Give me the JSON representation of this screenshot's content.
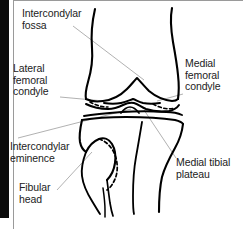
{
  "figure": {
    "kind": "anatomical-line-drawing",
    "bone_outline_color": "#000000",
    "leader_line_color": "#a8a8a8",
    "text_color": "#222222",
    "background_color": "#ffffff",
    "left_bar_color": "#0b0b0b",
    "panel_border_color": "#9a9a9a"
  },
  "labels": {
    "intercondylar_fossa": "Intercondylar\nfossa",
    "lateral_femoral_condyle": "Lateral\nfemoral\ncondyle",
    "intercondylar_eminence": "Intercondylar\neminence",
    "fibular_head": "Fibular\nhead",
    "medial_femoral_condyle": "Medial\nfemoral\ncondyle",
    "medial_tibial_plateau": "Medial tibial\nplateau"
  }
}
